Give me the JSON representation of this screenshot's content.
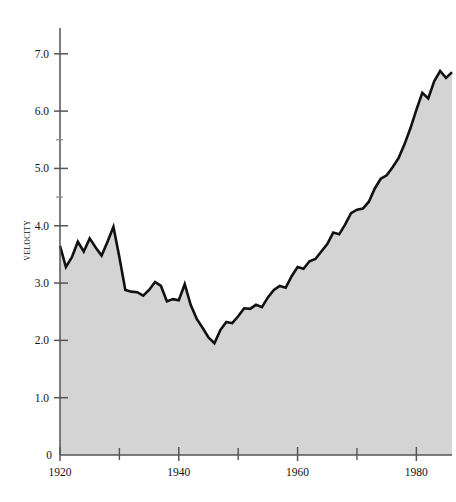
{
  "chart_data": {
    "type": "area",
    "title": "",
    "subtitle": "",
    "xlabel": "",
    "ylabel": "VELOCITY",
    "xlim": [
      1920,
      1986
    ],
    "ylim": [
      0,
      7.45
    ],
    "grid": false,
    "legend": null,
    "annotations": [],
    "series_name": "Velocity",
    "line_color": "#111111",
    "fill_color": "#d4d4d4",
    "axis_color": "#555555",
    "background_color": "#ffffff",
    "x_ticks_major": [
      1920,
      1940,
      1960,
      1980
    ],
    "x_tick_labels": [
      "1920",
      "1940",
      "1960",
      "1980"
    ],
    "x_ticks_minor": [
      1930,
      1950,
      1970
    ],
    "y_ticks_major": [
      1.0,
      2.0,
      3.0,
      4.0,
      5.0,
      6.0,
      7.0
    ],
    "y_tick_labels": [
      "1.0",
      "2.0",
      "3.0",
      "4.0",
      "5.0",
      "6.0",
      "7.0"
    ],
    "y_ticks_minor": [
      4.5,
      5.5
    ],
    "y_origin_label": "0",
    "x": [
      1920,
      1921,
      1922,
      1923,
      1924,
      1925,
      1926,
      1927,
      1928,
      1929,
      1930,
      1931,
      1932,
      1933,
      1934,
      1935,
      1936,
      1937,
      1938,
      1939,
      1940,
      1941,
      1942,
      1943,
      1944,
      1945,
      1946,
      1947,
      1948,
      1949,
      1950,
      1951,
      1952,
      1953,
      1954,
      1955,
      1956,
      1957,
      1958,
      1959,
      1960,
      1961,
      1962,
      1963,
      1964,
      1965,
      1966,
      1967,
      1968,
      1969,
      1970,
      1971,
      1972,
      1973,
      1974,
      1975,
      1976,
      1977,
      1978,
      1979,
      1980,
      1981,
      1982,
      1983,
      1984,
      1985
    ],
    "values": [
      3.65,
      3.28,
      3.45,
      3.72,
      3.55,
      3.78,
      3.62,
      3.48,
      3.72,
      3.98,
      3.45,
      2.88,
      2.85,
      2.84,
      2.78,
      2.88,
      3.02,
      2.95,
      2.68,
      2.72,
      2.7,
      2.98,
      2.62,
      2.38,
      2.22,
      2.05,
      1.95,
      2.18,
      2.32,
      2.3,
      2.42,
      2.56,
      2.55,
      2.62,
      2.58,
      2.75,
      2.88,
      2.95,
      2.92,
      3.12,
      3.28,
      3.25,
      3.38,
      3.42,
      3.55,
      3.68,
      3.88,
      3.85,
      4.02,
      4.22,
      4.28,
      4.3,
      4.42,
      4.65,
      4.82,
      4.88,
      5.02,
      5.18,
      5.42,
      5.7,
      6.02,
      6.32,
      6.22,
      6.52,
      6.7,
      6.58
    ],
    "final_value": 6.68
  },
  "axes": {
    "y_axis_name": "velocity-axis",
    "x_axis_name": "year-axis"
  }
}
